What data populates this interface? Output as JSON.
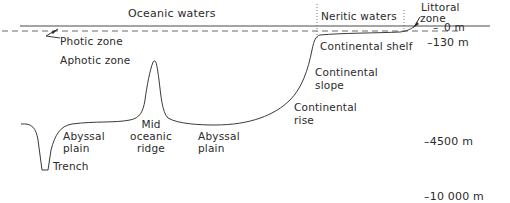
{
  "diagram": {
    "colors": {
      "line": "#3a3a3a",
      "text": "#2a2a2a",
      "background": "#ffffff"
    },
    "water_regions": {
      "oceanic": "Oceanic waters",
      "neritic": "Neritic waters",
      "littoral_line1": "Littoral",
      "littoral_line2": "zone"
    },
    "light_zones": {
      "photic": "Photic zone",
      "aphotic": "Aphotic zone"
    },
    "features": {
      "continental_shelf": "Continental shelf",
      "continental_slope_line1": "Continental",
      "continental_slope_line2": "slope",
      "continental_rise_line1": "Continental",
      "continental_rise_line2": "rise",
      "abyssal_plain_left_line1": "Abyssal",
      "abyssal_plain_left_line2": "plain",
      "mid_ridge_line1": "Mid",
      "mid_ridge_line2": "oceanic",
      "mid_ridge_line3": "ridge",
      "abyssal_plain_right_line1": "Abyssal",
      "abyssal_plain_right_line2": "plain",
      "trench": "Trench"
    },
    "depths": {
      "d0": "0 m",
      "d130": "–130 m",
      "d4500": "–4500 m",
      "d10000": "–10 000 m"
    }
  }
}
